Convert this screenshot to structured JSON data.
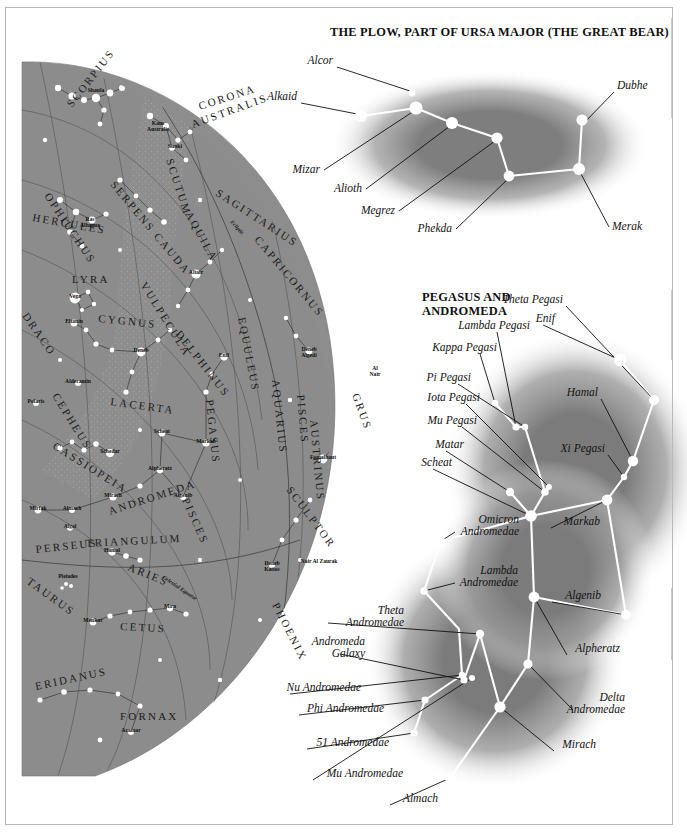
{
  "page": {
    "kind": "star-chart-plate",
    "background": "#ffffff",
    "frame_color": "#b9b9b9",
    "sky_fill": "#8f8f8f",
    "star_color": "#ffffff",
    "constellation_line_color": "#ffffff"
  },
  "plow": {
    "title": "THE PLOW, PART OF URSA MAJOR (THE GREAT BEAR)",
    "stars": [
      {
        "name": "Alcor",
        "x": 412,
        "y": 93,
        "r": 3.4,
        "label_x": 333,
        "label_y": 64,
        "anchor": "end"
      },
      {
        "name": "Alkaid",
        "x": 361,
        "y": 116,
        "r": 6.0,
        "label_x": 297,
        "label_y": 100,
        "anchor": "end"
      },
      {
        "name": "Mizar",
        "x": 416,
        "y": 108,
        "r": 6.6,
        "label_x": 320,
        "label_y": 173,
        "anchor": "end"
      },
      {
        "name": "Alioth",
        "x": 452,
        "y": 123,
        "r": 6.0,
        "label_x": 362,
        "label_y": 192,
        "anchor": "end"
      },
      {
        "name": "Megrez",
        "x": 497,
        "y": 138,
        "r": 5.6,
        "label_x": 395,
        "label_y": 214,
        "anchor": "end"
      },
      {
        "name": "Phekda",
        "x": 509,
        "y": 176,
        "r": 5.4,
        "label_x": 452,
        "label_y": 232,
        "anchor": "end"
      },
      {
        "name": "Merak",
        "x": 579,
        "y": 169,
        "r": 6.0,
        "label_x": 612,
        "label_y": 230,
        "anchor": "start"
      },
      {
        "name": "Dubhe",
        "x": 582,
        "y": 120,
        "r": 5.6,
        "label_x": 617,
        "label_y": 89,
        "anchor": "start"
      }
    ],
    "segments": [
      [
        361,
        116,
        416,
        108
      ],
      [
        416,
        108,
        452,
        123
      ],
      [
        452,
        123,
        497,
        138
      ],
      [
        497,
        138,
        509,
        176
      ],
      [
        509,
        176,
        579,
        169
      ],
      [
        579,
        169,
        582,
        120
      ]
    ],
    "leaders": [
      [
        337,
        67,
        410,
        91
      ],
      [
        301,
        103,
        357,
        114
      ],
      [
        324,
        170,
        414,
        111
      ],
      [
        366,
        189,
        450,
        126
      ],
      [
        399,
        211,
        495,
        141
      ],
      [
        456,
        229,
        508,
        179
      ],
      [
        609,
        227,
        580,
        172
      ],
      [
        614,
        92,
        584,
        123
      ]
    ]
  },
  "pegasus": {
    "title_line1": "PEGASUS AND",
    "title_line2": "ANDROMEDA",
    "stars": [
      {
        "name": "Theta Pegasi",
        "x": 654,
        "y": 400,
        "r": 5.0,
        "label_x": 563,
        "label_y": 303,
        "anchor": "end",
        "lx": 566,
        "ly": 306
      },
      {
        "name": "Enif",
        "x": 620,
        "y": 360,
        "r": 6.2,
        "label_x": 555,
        "label_y": 322,
        "anchor": "end",
        "lx": 543,
        "ly": 325
      },
      {
        "name": "Hamal",
        "x": 633,
        "y": 461,
        "r": 5.2,
        "label_x": 598,
        "label_y": 396,
        "anchor": "end",
        "lx": 601,
        "ly": 399
      },
      {
        "name": "Xi Pegasi",
        "x": 624,
        "y": 477,
        "r": 3.2,
        "label_x": 605,
        "label_y": 452,
        "anchor": "end",
        "lx": 608,
        "ly": 455
      },
      {
        "name": "Lambda Pegasi",
        "x": 516,
        "y": 427,
        "r": 3.6,
        "label_x": 530,
        "label_y": 329,
        "anchor": "end",
        "lx": 497,
        "ly": 332
      },
      {
        "name": "Kappa Pegasi",
        "x": 495,
        "y": 403,
        "r": 3.2,
        "label_x": 497,
        "label_y": 351,
        "anchor": "end",
        "lx": 480,
        "ly": 354
      },
      {
        "name": "Pi Pegasi",
        "x": 525,
        "y": 427,
        "r": 3.2,
        "label_x": 471,
        "label_y": 381,
        "anchor": "end",
        "lx": 458,
        "ly": 384
      },
      {
        "name": "Iota Pegasi",
        "x": 549,
        "y": 487,
        "r": 3.0,
        "label_x": 480,
        "label_y": 401,
        "anchor": "end",
        "lx": 466,
        "ly": 404
      },
      {
        "name": "Mu Pegasi",
        "x": 545,
        "y": 492,
        "r": 3.8,
        "label_x": 477,
        "label_y": 424,
        "anchor": "end",
        "lx": 462,
        "ly": 427
      },
      {
        "name": "Matar",
        "x": 510,
        "y": 492,
        "r": 4.2,
        "label_x": 464,
        "label_y": 448,
        "anchor": "end",
        "lx": 446,
        "ly": 451
      },
      {
        "name": "Scheat",
        "x": 531,
        "y": 516,
        "r": 5.8,
        "label_x": 452,
        "label_y": 466,
        "anchor": "end",
        "lx": 433,
        "ly": 469
      },
      {
        "name": "Markab",
        "x": 607,
        "y": 500,
        "r": 5.4,
        "label_x": 600,
        "label_y": 525,
        "anchor": "end",
        "lx": 551,
        "ly": 528
      },
      {
        "name": "Algenib",
        "x": 626,
        "y": 615,
        "r": 5.0,
        "label_x": 601,
        "label_y": 599,
        "anchor": "end",
        "lx": 552,
        "ly": 602
      },
      {
        "name": "Alpheratz",
        "x": 534,
        "y": 597,
        "r": 5.4,
        "label_x": 620,
        "label_y": 652,
        "anchor": "end",
        "lx": 567,
        "ly": 655
      },
      {
        "name": "Omicron Andromedae",
        "x": 441,
        "y": 541,
        "r": 4.4,
        "label_x": 519,
        "label_y": 529,
        "anchor": "end",
        "lx": 455,
        "ly": 532
      },
      {
        "name": "Lambda Andromedae",
        "x": 424,
        "y": 591,
        "r": 3.8,
        "label_x": 518,
        "label_y": 580,
        "anchor": "end",
        "lx": 455,
        "ly": 583
      },
      {
        "name": "Delta Andromedae",
        "x": 528,
        "y": 664,
        "r": 4.6,
        "label_x": 625,
        "label_y": 707,
        "anchor": "end",
        "lx": 573,
        "ly": 710
      },
      {
        "name": "Mirach",
        "x": 500,
        "y": 707,
        "r": 5.6,
        "label_x": 596,
        "label_y": 748,
        "anchor": "end",
        "lx": 554,
        "ly": 751
      },
      {
        "name": "Theta Andromedae",
        "x": 480,
        "y": 634,
        "r": 4.2,
        "label_x": 404,
        "label_y": 620,
        "anchor": "end",
        "lx": 328,
        "ly": 623
      },
      {
        "name": "Andromeda Galaxy",
        "x": 464,
        "y": 680,
        "r": 3.6,
        "label_x": 365,
        "label_y": 651,
        "anchor": "end",
        "lx": 340,
        "ly": 654
      },
      {
        "name": "Nu Andromedae",
        "x": 462,
        "y": 675,
        "r": 3.2,
        "label_x": 361,
        "label_y": 691,
        "anchor": "end",
        "lx": 290,
        "ly": 694
      },
      {
        "name": "Phi Andromedae",
        "x": 425,
        "y": 700,
        "r": 3.6,
        "label_x": 384,
        "label_y": 712,
        "anchor": "end",
        "lx": 299,
        "ly": 715
      },
      {
        "name": "51 Andromedae",
        "x": 414,
        "y": 733,
        "r": 3.6,
        "label_x": 389,
        "label_y": 746,
        "anchor": "end",
        "lx": 307,
        "ly": 749
      },
      {
        "name": "Mu Andromedae",
        "x": 472,
        "y": 678,
        "r": 3.0,
        "label_x": 403,
        "label_y": 777,
        "anchor": "end",
        "lx": 313,
        "ly": 780
      },
      {
        "name": "Almach",
        "x": 450,
        "y": 778,
        "r": 5.2,
        "label_x": 438,
        "label_y": 802,
        "anchor": "end",
        "lx": 390,
        "ly": 805
      }
    ],
    "segments": [
      [
        620,
        360,
        654,
        400
      ],
      [
        654,
        400,
        633,
        461
      ],
      [
        633,
        461,
        624,
        477
      ],
      [
        624,
        477,
        607,
        500
      ],
      [
        607,
        500,
        626,
        615
      ],
      [
        626,
        615,
        534,
        597
      ],
      [
        534,
        597,
        531,
        516
      ],
      [
        531,
        516,
        607,
        500
      ],
      [
        545,
        492,
        531,
        516
      ],
      [
        549,
        487,
        545,
        492
      ],
      [
        525,
        427,
        545,
        492
      ],
      [
        516,
        427,
        525,
        427
      ],
      [
        495,
        403,
        516,
        427
      ],
      [
        510,
        492,
        531,
        516
      ],
      [
        531,
        516,
        441,
        541
      ],
      [
        441,
        541,
        424,
        591
      ],
      [
        424,
        591,
        459,
        629
      ],
      [
        534,
        597,
        528,
        664
      ],
      [
        528,
        664,
        500,
        707
      ],
      [
        500,
        707,
        480,
        634
      ],
      [
        480,
        634,
        464,
        680
      ],
      [
        464,
        680,
        462,
        675
      ],
      [
        462,
        675,
        425,
        700
      ],
      [
        425,
        700,
        414,
        733
      ],
      [
        500,
        707,
        450,
        778
      ],
      [
        459,
        629,
        462,
        675
      ]
    ]
  },
  "main_chart": {
    "constellations": [
      {
        "name": "SCORPIUS",
        "x": 72,
        "y": 108,
        "rot": -52
      },
      {
        "name": "OPHIUCHUS",
        "x": 44,
        "y": 196,
        "rot": 56
      },
      {
        "name": "SERPENS CAUDA",
        "x": 110,
        "y": 185,
        "rot": 50
      },
      {
        "name": "SCUTUM",
        "x": 166,
        "y": 160,
        "rot": 72
      },
      {
        "name": "CORONA",
        "x": 200,
        "y": 110,
        "rot": -18
      },
      {
        "name": "AUSTRALIS",
        "x": 193,
        "y": 128,
        "rot": -20
      },
      {
        "name": "SAGITTARIUS",
        "x": 215,
        "y": 195,
        "rot": 33
      },
      {
        "name": "HERCULES",
        "x": 32,
        "y": 221,
        "rot": 10
      },
      {
        "name": "AQUILA",
        "x": 185,
        "y": 214,
        "rot": 61
      },
      {
        "name": "CAPRICORNUS",
        "x": 254,
        "y": 240,
        "rot": 50
      },
      {
        "name": "LYRA",
        "x": 72,
        "y": 283,
        "rot": 0
      },
      {
        "name": "VULPECULA",
        "x": 140,
        "y": 285,
        "rot": 58
      },
      {
        "name": "CYGNUS",
        "x": 98,
        "y": 322,
        "rot": 6
      },
      {
        "name": "DELPHINUS",
        "x": 175,
        "y": 334,
        "rot": 52
      },
      {
        "name": "DRACO",
        "x": 22,
        "y": 316,
        "rot": 55
      },
      {
        "name": "EQUULEUS",
        "x": 238,
        "y": 318,
        "rot": 79
      },
      {
        "name": "AQUARIUS",
        "x": 272,
        "y": 380,
        "rot": 84
      },
      {
        "name": "CEPHEUS",
        "x": 52,
        "y": 396,
        "rot": 58
      },
      {
        "name": "LACERTA",
        "x": 110,
        "y": 405,
        "rot": 8
      },
      {
        "name": "PEGASUS",
        "x": 206,
        "y": 400,
        "rot": 84
      },
      {
        "name": "PISCES",
        "x": 297,
        "y": 395,
        "rot": 85
      },
      {
        "name": "AUSTRINUS",
        "x": 310,
        "y": 420,
        "rot": 85
      },
      {
        "name": "GRUS",
        "x": 352,
        "y": 395,
        "rot": 70
      },
      {
        "name": "CASSIOPEIA",
        "x": 52,
        "y": 448,
        "rot": 32
      },
      {
        "name": "ANDROMEDA",
        "x": 110,
        "y": 515,
        "rot": -18
      },
      {
        "name": "PISCES",
        "x": 182,
        "y": 500,
        "rot": 66
      },
      {
        "name": "SCULPTOR",
        "x": 286,
        "y": 490,
        "rot": 53
      },
      {
        "name": "PERSEUS",
        "x": 36,
        "y": 553,
        "rot": -6
      },
      {
        "name": "TRIANGULUM",
        "x": 86,
        "y": 547,
        "rot": -3
      },
      {
        "name": "ARIES",
        "x": 127,
        "y": 570,
        "rot": 22
      },
      {
        "name": "PHOENIX",
        "x": 272,
        "y": 605,
        "rot": 63
      },
      {
        "name": "TAURUS",
        "x": 26,
        "y": 583,
        "rot": 36
      },
      {
        "name": "CETUS",
        "x": 120,
        "y": 630,
        "rot": 3
      },
      {
        "name": "ERIDANUS",
        "x": 36,
        "y": 690,
        "rot": -12
      },
      {
        "name": "FORNAX",
        "x": 120,
        "y": 720,
        "rot": 0
      }
    ],
    "stars": [
      {
        "name": "Shaula",
        "x": 96,
        "y": 92
      },
      {
        "name": "Kaus Australis",
        "x": 158,
        "y": 125
      },
      {
        "name": "Sunki",
        "x": 175,
        "y": 148
      },
      {
        "name": "Ras Alhague",
        "x": 90,
        "y": 221
      },
      {
        "name": "Altair",
        "x": 196,
        "y": 274
      },
      {
        "name": "Vega",
        "x": 75,
        "y": 298
      },
      {
        "name": "Eltanin",
        "x": 74,
        "y": 323
      },
      {
        "name": "Deneb",
        "x": 141,
        "y": 352
      },
      {
        "name": "Alderamin",
        "x": 78,
        "y": 383
      },
      {
        "name": "Polaris",
        "x": 36,
        "y": 403
      },
      {
        "name": "Enif",
        "x": 224,
        "y": 357
      },
      {
        "name": "Deneb Algedi",
        "x": 309,
        "y": 351
      },
      {
        "name": "Al Nair",
        "x": 375,
        "y": 370
      },
      {
        "name": "Fomalhaut",
        "x": 323,
        "y": 459
      },
      {
        "name": "Scheat",
        "x": 162,
        "y": 433
      },
      {
        "name": "Markab",
        "x": 206,
        "y": 443
      },
      {
        "name": "Schedar",
        "x": 110,
        "y": 453
      },
      {
        "name": "Alpheratz",
        "x": 160,
        "y": 470
      },
      {
        "name": "Algenib",
        "x": 183,
        "y": 497
      },
      {
        "name": "Mirach",
        "x": 113,
        "y": 497
      },
      {
        "name": "Almach",
        "x": 72,
        "y": 510
      },
      {
        "name": "Mirfak",
        "x": 38,
        "y": 510
      },
      {
        "name": "Algol",
        "x": 70,
        "y": 528
      },
      {
        "name": "Hamal",
        "x": 112,
        "y": 552
      },
      {
        "name": "Pleiades",
        "x": 68,
        "y": 578
      },
      {
        "name": "Deneb Kaitos",
        "x": 272,
        "y": 565
      },
      {
        "name": "Nair Al Zaurak",
        "x": 319,
        "y": 563
      },
      {
        "name": "Mira",
        "x": 170,
        "y": 608
      },
      {
        "name": "Menkar",
        "x": 93,
        "y": 622
      },
      {
        "name": "Acamar",
        "x": 131,
        "y": 732
      }
    ],
    "lines": [
      {
        "name": "Ecliptic",
        "x": 230,
        "y": 222,
        "rot": 48
      },
      {
        "name": "Celestial Equator",
        "x": 162,
        "y": 578,
        "rot": 34
      }
    ]
  }
}
